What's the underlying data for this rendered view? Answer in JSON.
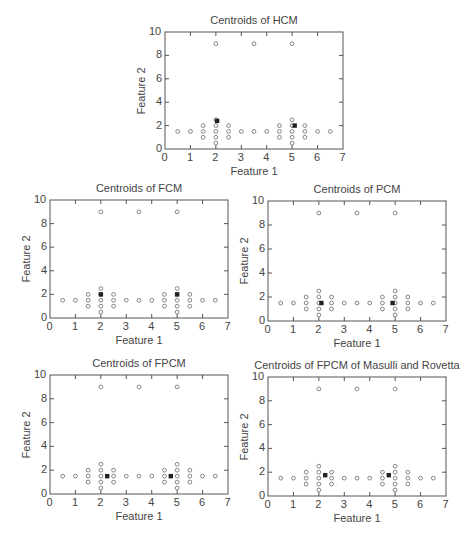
{
  "chart_data": [
    {
      "id": "hcm",
      "type": "scatter",
      "title": "Centroids of HCM",
      "xlabel": "Feature 1",
      "ylabel": "Feature 2",
      "xlim": [
        0,
        7
      ],
      "ylim": [
        0,
        10
      ],
      "xticks": [
        "0",
        "1",
        "2",
        "3",
        "4",
        "5",
        "6",
        "7"
      ],
      "yticks": [
        "0",
        "2",
        "4",
        "6",
        "8",
        "10"
      ],
      "grid": false,
      "box": {
        "left": 165,
        "top": 32,
        "right": 343,
        "bottom": 149
      },
      "centroids": [
        [
          2.05,
          2.4
        ],
        [
          5.1,
          2.0
        ]
      ]
    },
    {
      "id": "fcm",
      "type": "scatter",
      "title": "Centroids of FCM",
      "xlabel": "Feature 1",
      "ylabel": "Feature 2",
      "xlim": [
        0,
        7
      ],
      "ylim": [
        0,
        10
      ],
      "xticks": [
        "0",
        "1",
        "2",
        "3",
        "4",
        "5",
        "6",
        "7"
      ],
      "yticks": [
        "0",
        "2",
        "4",
        "6",
        "8",
        "10"
      ],
      "grid": false,
      "box": {
        "left": 50,
        "top": 200,
        "right": 228,
        "bottom": 318
      },
      "centroids": [
        [
          2.0,
          2.0
        ],
        [
          5.0,
          2.0
        ]
      ]
    },
    {
      "id": "pcm",
      "type": "scatter",
      "title": "Centroids of PCM",
      "xlabel": "Feature 1",
      "ylabel": "Feature 2",
      "xlim": [
        0,
        7
      ],
      "ylim": [
        0,
        10
      ],
      "xticks": [
        "0",
        "1",
        "2",
        "3",
        "4",
        "5",
        "6",
        "7"
      ],
      "yticks": [
        "0",
        "2",
        "4",
        "6",
        "8",
        "10"
      ],
      "grid": false,
      "box": {
        "left": 268,
        "top": 201,
        "right": 446,
        "bottom": 321
      },
      "centroids": [
        [
          2.1,
          1.5
        ],
        [
          4.9,
          1.5
        ]
      ]
    },
    {
      "id": "fpcm",
      "type": "scatter",
      "title": "Centroids of FPCM",
      "xlabel": "Feature 1",
      "ylabel": "Feature 2",
      "xlim": [
        0,
        7
      ],
      "ylim": [
        0,
        10
      ],
      "xticks": [
        "0",
        "1",
        "2",
        "3",
        "4",
        "5",
        "6",
        "7"
      ],
      "yticks": [
        "0",
        "2",
        "4",
        "6",
        "8",
        "10"
      ],
      "grid": false,
      "box": {
        "left": 50,
        "top": 375,
        "right": 228,
        "bottom": 494
      },
      "centroids": [
        [
          2.25,
          1.5
        ],
        [
          4.75,
          1.5
        ]
      ]
    },
    {
      "id": "fpcm-mr",
      "type": "scatter",
      "title": "Centroids of FPCM of Masulli and Rovetta",
      "xlabel": "Feature 1",
      "ylabel": "Feature 2",
      "xlim": [
        0,
        7
      ],
      "ylim": [
        0,
        10
      ],
      "xticks": [
        "0",
        "1",
        "2",
        "3",
        "4",
        "5",
        "6",
        "7"
      ],
      "yticks": [
        "0",
        "2",
        "4",
        "6",
        "8",
        "10"
      ],
      "grid": false,
      "box": {
        "left": 268,
        "top": 377,
        "right": 446,
        "bottom": 496
      },
      "centroids": [
        [
          2.25,
          1.75
        ],
        [
          4.75,
          1.75
        ]
      ]
    }
  ],
  "data_points": [
    [
      0.5,
      1.5
    ],
    [
      1.0,
      1.5
    ],
    [
      1.5,
      1.0
    ],
    [
      1.5,
      1.5
    ],
    [
      1.5,
      2.0
    ],
    [
      2.0,
      0.5
    ],
    [
      2.0,
      1.0
    ],
    [
      2.0,
      1.5
    ],
    [
      2.0,
      2.0
    ],
    [
      2.0,
      2.5
    ],
    [
      2.0,
      9.0
    ],
    [
      2.5,
      1.0
    ],
    [
      2.5,
      1.5
    ],
    [
      2.5,
      2.0
    ],
    [
      3.0,
      1.5
    ],
    [
      3.5,
      1.5
    ],
    [
      3.5,
      9.0
    ],
    [
      4.0,
      1.5
    ],
    [
      4.5,
      1.0
    ],
    [
      4.5,
      1.5
    ],
    [
      4.5,
      2.0
    ],
    [
      5.0,
      0.5
    ],
    [
      5.0,
      1.0
    ],
    [
      5.0,
      1.5
    ],
    [
      5.0,
      2.0
    ],
    [
      5.0,
      2.5
    ],
    [
      5.0,
      9.0
    ],
    [
      5.5,
      1.0
    ],
    [
      5.5,
      1.5
    ],
    [
      5.5,
      2.0
    ],
    [
      6.0,
      1.5
    ],
    [
      6.5,
      1.5
    ]
  ],
  "colors": {
    "axis": "#555555",
    "point_stroke": "#777777",
    "centroid_fill": "#222222",
    "text": "#444444"
  }
}
